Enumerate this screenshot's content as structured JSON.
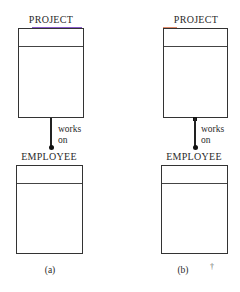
{
  "diagrams": [
    {
      "id": "a",
      "caption": "(a)",
      "top_entity": {
        "name": "PROJECT"
      },
      "bottom_entity": {
        "name": "EMPLOYEE"
      },
      "relationship": {
        "line1": "works",
        "line2": "on",
        "top_end": "plain",
        "bottom_end": "dot"
      }
    },
    {
      "id": "b",
      "caption": "(b)",
      "top_entity": {
        "name": "PROJECT"
      },
      "bottom_entity": {
        "name": "EMPLOYEE"
      },
      "relationship": {
        "line1": "works",
        "line2": "on",
        "top_end": "square",
        "bottom_end": "dot"
      }
    }
  ],
  "stray_mark": "†",
  "colors": {
    "line": "#222222",
    "box_border": "#333333",
    "accent_a": "#8a5cc9",
    "accent_b": "#e08a6a"
  }
}
